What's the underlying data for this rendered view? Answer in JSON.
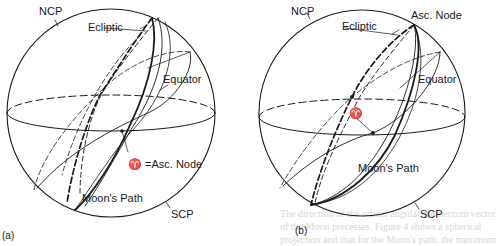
{
  "figure": {
    "panels": [
      {
        "id": "a",
        "tag": "(a)",
        "labels": {
          "ncp": "NCP",
          "scp": "SCP",
          "ecliptic": "Ecliptic",
          "equator": "Equator",
          "moons_path": "Moon's Path",
          "node": "♈ =Asc. Node"
        }
      },
      {
        "id": "b",
        "tag": "(b)",
        "labels": {
          "ncp": "NCP",
          "scp": "SCP",
          "ecliptic": "Ecliptic",
          "equator": "Equator",
          "moons_path": "Moon's Path",
          "aries": "♈",
          "asc_node": "Asc. Node"
        }
      }
    ],
    "background_text": [
      "The direction of the orbital angular momentum vector",
      "of the Moon precesses. Figure 4 shows a spherical",
      "projection and that for the Moon's path; the maximum"
    ],
    "colors": {
      "ink": "#1a1a1a",
      "paper": "#ffffff",
      "show_through": "#d6d6d6"
    }
  }
}
